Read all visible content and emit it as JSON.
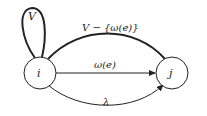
{
  "diagram": {
    "nodes": [
      {
        "id": "i",
        "label": "i"
      },
      {
        "id": "j",
        "label": "j"
      }
    ],
    "edges": [
      {
        "from": "i",
        "to": "i",
        "label": "V",
        "type": "self-loop"
      },
      {
        "from": "i",
        "to": "j",
        "label": "V − {ω(e)}",
        "type": "upper-arc-thick"
      },
      {
        "from": "i",
        "to": "j",
        "label": "ω(e)",
        "type": "straight"
      },
      {
        "from": "i",
        "to": "j",
        "label": "λ",
        "type": "lower-arc"
      }
    ]
  }
}
